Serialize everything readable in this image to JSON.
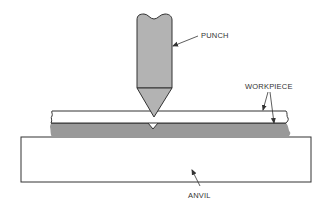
{
  "diagram": {
    "type": "mechanical-cross-section",
    "labels": {
      "punch": "PUNCH",
      "workpiece": "WORKPIECE",
      "anvil": "ANVIL"
    },
    "colors": {
      "punch_fill": "#b3b3b3",
      "lower_workpiece_fill": "#999999",
      "upper_workpiece_fill": "#ffffff",
      "anvil_fill": "#ffffff",
      "outline": "#333333",
      "background": "#ffffff"
    }
  }
}
